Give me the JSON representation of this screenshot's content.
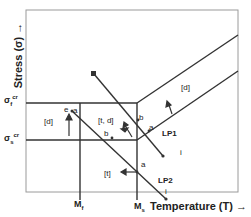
{
  "diagram": {
    "y_axis_label": "Stress (σ) →",
    "x_axis_label": "Temperature (T) →",
    "ticks": {
      "sigma_f": {
        "base": "σ",
        "sub": "f",
        "sup": "cr"
      },
      "sigma_s": {
        "base": "σ",
        "sub": "s",
        "sup": "cr"
      },
      "m_f": {
        "base": "M",
        "sub": "f"
      },
      "m_s": {
        "base": "M",
        "sub": "s"
      }
    },
    "regions": {
      "d_left": "[d]",
      "t_d": "[t, d]",
      "t": "[t]",
      "d_right": "[d]"
    },
    "points": {
      "e": "e",
      "a_top": "a",
      "b_top": "b",
      "b_mid": "b",
      "b_left": "b",
      "a_mid": "a",
      "a_lp1": "a",
      "i_lp1": "i",
      "i_lp2": "i"
    },
    "load_paths": {
      "lp1": "LP1",
      "lp2": "LP2"
    },
    "colors": {
      "line": "#222222",
      "frame": "#9a9a9a"
    }
  }
}
